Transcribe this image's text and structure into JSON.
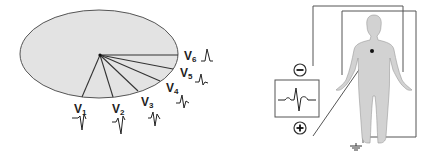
{
  "figure": {
    "left_panel": {
      "description": "Horizontal plane view of precordial leads V1-V6 radiating from heart",
      "leads": [
        {
          "name": "V",
          "sub": "1"
        },
        {
          "name": "V",
          "sub": "2"
        },
        {
          "name": "V",
          "sub": "3"
        },
        {
          "name": "V",
          "sub": "4"
        },
        {
          "name": "V",
          "sub": "5"
        },
        {
          "name": "V",
          "sub": "6"
        }
      ],
      "colors": {
        "plane_fill": "#e3e3e3",
        "stroke": "#444444"
      }
    },
    "right_panel": {
      "description": "Body with chest electrode connected to ECG recorder",
      "negative_symbol": "−",
      "positive_symbol": "+",
      "colors": {
        "body_fill": "#d2d2d2",
        "stroke": "#444444"
      }
    }
  }
}
